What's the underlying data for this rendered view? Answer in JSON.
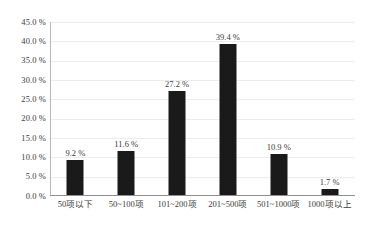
{
  "chart_data": {
    "type": "bar",
    "title": "",
    "xlabel": "",
    "ylabel": "",
    "categories": [
      "50项以下",
      "50~100项",
      "101~200项",
      "201~500项",
      "501~1000项",
      "1000项以上"
    ],
    "values": [
      9.2,
      11.6,
      27.2,
      39.4,
      10.9,
      1.7
    ],
    "value_labels": [
      "9.2 %",
      "11.6 %",
      "27.2 %",
      "39.4 %",
      "10.9 %",
      "1.7 %"
    ],
    "ylim": [
      0,
      45
    ],
    "ytick_values": [
      0,
      5,
      10,
      15,
      20,
      25,
      30,
      35,
      40,
      45
    ],
    "ytick_labels": [
      "0.0 %",
      "5.0 %",
      "10.0 %",
      "15.0 %",
      "20.0 %",
      "25.0 %",
      "30.0 %",
      "35.0 %",
      "40.0 %",
      "45.0 %"
    ],
    "grid": true,
    "legend": "none",
    "bar_color": "#1a1a1a",
    "grid_color": "#ececec",
    "axis_color": "#8f8f8f",
    "background_color": "#ffffff"
  }
}
